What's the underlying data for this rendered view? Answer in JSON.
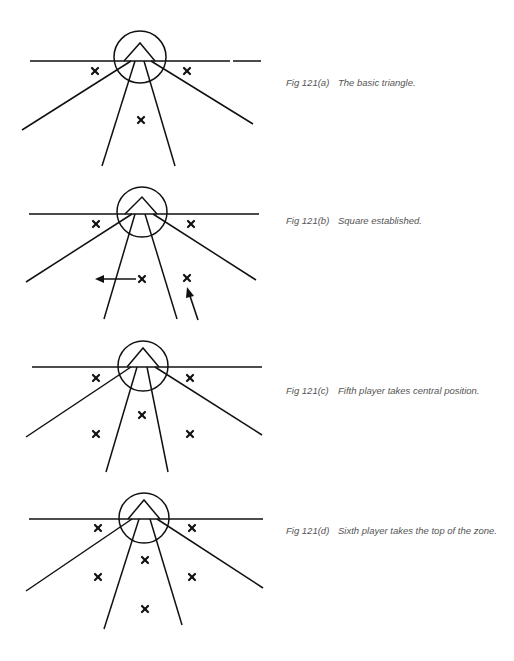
{
  "figures": [
    {
      "id": "a",
      "label": "Fig 121(a)",
      "caption": "The basic triangle.",
      "players": 3,
      "arrows": 0
    },
    {
      "id": "b",
      "label": "Fig 121(b)",
      "caption": "Square established.",
      "players": 4,
      "arrows": 2
    },
    {
      "id": "c",
      "label": "Fig 121(c)",
      "caption": "Fifth player takes central position.",
      "players": 5,
      "arrows": 0
    },
    {
      "id": "d",
      "label": "Fig 121(d)",
      "caption": "Sixth player takes the top of the zone.",
      "players": 6,
      "arrows": 0
    }
  ],
  "colors": {
    "ink": "#111111",
    "caption": "#555555",
    "background": "#ffffff"
  }
}
